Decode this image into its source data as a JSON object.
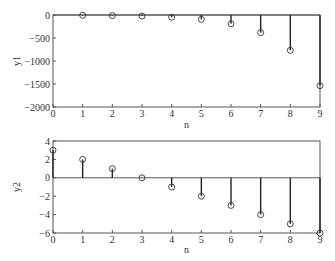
{
  "chart_data": [
    {
      "type": "stem",
      "title": "",
      "xlabel": "n",
      "ylabel": "y1",
      "x": [
        1,
        2,
        3,
        4,
        5,
        6,
        7,
        8,
        9
      ],
      "values": [
        -6,
        -12,
        -24,
        -48,
        -96,
        -192,
        -384,
        -768,
        -1536
      ],
      "xlim": [
        0,
        9
      ],
      "ylim": [
        -2000,
        0
      ],
      "xticks": [
        "0",
        "1",
        "2",
        "3",
        "4",
        "5",
        "6",
        "7",
        "8",
        "9"
      ],
      "yticks": [
        "0",
        "-500",
        "-1000",
        "-1500",
        "-2000"
      ],
      "grid": false,
      "marker": "open-circle"
    },
    {
      "type": "stem",
      "title": "",
      "xlabel": "n",
      "ylabel": "y2",
      "x": [
        0,
        1,
        2,
        3,
        4,
        5,
        6,
        7,
        8,
        9
      ],
      "values": [
        3,
        2,
        1,
        0,
        -1,
        -2,
        -3,
        -4,
        -5,
        -6
      ],
      "xlim": [
        0,
        9
      ],
      "ylim": [
        -6,
        4
      ],
      "xticks": [
        "0",
        "1",
        "2",
        "3",
        "4",
        "5",
        "6",
        "7",
        "8",
        "9"
      ],
      "yticks": [
        "4",
        "2",
        "0",
        "-2",
        "-4",
        "-6"
      ],
      "grid": false,
      "marker": "open-circle"
    }
  ],
  "colors": {
    "axis": "#555555",
    "stem": "#222222",
    "marker": "#333333"
  }
}
